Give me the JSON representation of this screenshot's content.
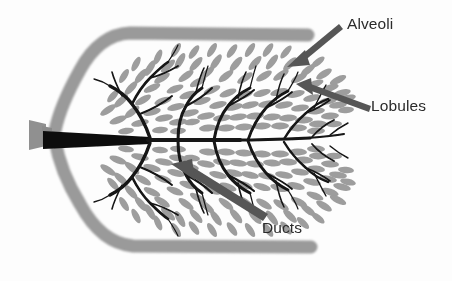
{
  "diagram": {
    "background_color": "#fdfdfd",
    "colors": {
      "tissue_gray": "#9b9b9b",
      "outline_gray": "#9a9a9a",
      "duct_black": "#111111",
      "arrow_gray": "#565656",
      "label_text": "#2b2b2b"
    },
    "annotations": [
      {
        "id": "alveoli",
        "label": "Alveoli",
        "label_x": 347,
        "label_y": 16,
        "arrow_from_x": 339,
        "arrow_from_y": 24,
        "arrow_to_x": 288,
        "arrow_to_y": 66,
        "points_at": "grape-like clusters of gray sacs at the tips of the branches"
      },
      {
        "id": "lobules",
        "label": "Lobules",
        "label_x": 371,
        "label_y": 98,
        "arrow_from_x": 369,
        "arrow_from_y": 109,
        "arrow_to_x": 298,
        "arrow_to_y": 85,
        "points_at": "clustered groups of alveoli on a secondary branch"
      },
      {
        "id": "ducts",
        "label": "Ducts",
        "label_x": 262,
        "label_y": 220,
        "arrow_from_x": 264,
        "arrow_from_y": 219,
        "arrow_to_x": 171,
        "arrow_to_y": 165,
        "points_at": "the black branching tubes of the ductal tree"
      }
    ],
    "parts": {
      "nipple": "gray trapezoid at far left where the main duct exits",
      "main_duct": "thick black wedge running horizontally from the nipple into the tissue",
      "breast_outline": "thick gray band forming the rounded breast profile",
      "alveoli_count_approx": 190
    }
  }
}
